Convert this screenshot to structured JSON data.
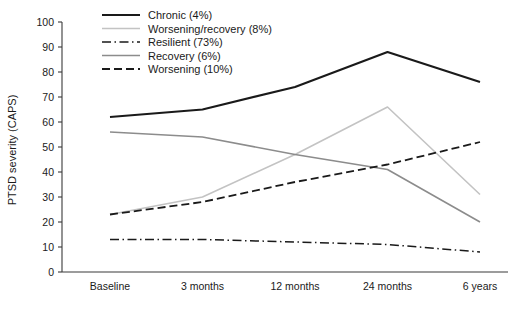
{
  "chart_data": {
    "type": "line",
    "title": "",
    "xlabel": "",
    "ylabel": "PTSD severity (CAPS)",
    "categories": [
      "Baseline",
      "3 months",
      "12 months",
      "24 months",
      "6 years"
    ],
    "ylim": [
      0,
      100
    ],
    "yticks": [
      0,
      10,
      20,
      30,
      40,
      50,
      60,
      70,
      80,
      90,
      100
    ],
    "grid": false,
    "legend_position": "top-center",
    "series": [
      {
        "name": "Chronic (4%)",
        "label": "Chronic (4%)",
        "style": "solid",
        "color": "#1a1a1a",
        "width": 2.2,
        "values": [
          62,
          65,
          74,
          88,
          76
        ]
      },
      {
        "name": "Worsening/recovery (8%)",
        "label": "Worsening/recovery (8%)",
        "style": "solid",
        "color": "#c3c3c3",
        "width": 1.6,
        "values": [
          23,
          30,
          47,
          66,
          31
        ]
      },
      {
        "name": "Resilient (73%)",
        "label": "Resilient (73%)",
        "style": "dashdot",
        "color": "#1a1a1a",
        "width": 1.5,
        "values": [
          13,
          13,
          12,
          11,
          8
        ]
      },
      {
        "name": "Recovery (6%)",
        "label": "Recovery (6%)",
        "style": "solid",
        "color": "#8c8c8c",
        "width": 1.6,
        "values": [
          56,
          54,
          47,
          41,
          20
        ]
      },
      {
        "name": "Worsening (10%)",
        "label": "Worsening (10%)",
        "style": "dashed",
        "color": "#1a1a1a",
        "width": 1.8,
        "values": [
          23,
          28,
          36,
          43,
          52
        ]
      }
    ]
  }
}
